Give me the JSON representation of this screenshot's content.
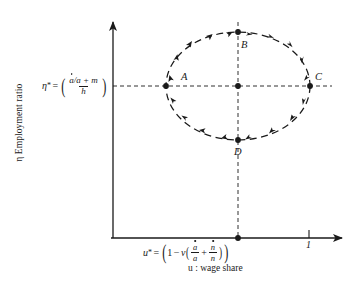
{
  "figure": {
    "type": "phase-portrait",
    "background_color": "#ffffff",
    "line_color": "#1a1a1a"
  },
  "axes": {
    "y": {
      "name": "y-axis",
      "label": "η Employment ratio",
      "symbol": "η",
      "equilibrium": {
        "lhs": "η",
        "superscript": "*",
        "equals": "=",
        "numerator_a_dot": "a",
        "numerator_rest": "/a + m",
        "denominator": "h",
        "plain": "η* = ( (ȧ/a + m) / h )"
      }
    },
    "x": {
      "name": "x-axis",
      "label": "u : wage share",
      "symbol": "u",
      "tick_label": "1",
      "equilibrium": {
        "lhs": "u",
        "superscript": "*",
        "equals": "=",
        "one": "1",
        "minus": "−",
        "v": "v",
        "frac1_num": "a",
        "frac1_den": "a",
        "plus": "+",
        "frac2_num": "n",
        "frac2_den": "n",
        "plain": "u* = ( 1 − v ( ȧ/a + ṅ/n ) )"
      }
    }
  },
  "cycle": {
    "name": "limit-cycle",
    "style": "dashed",
    "direction": "clockwise",
    "center": {
      "x": 238,
      "y": 86
    },
    "radius_x": 72,
    "radius_y": 54,
    "points": [
      {
        "id": "A",
        "label": "A",
        "position": "left",
        "x": 166,
        "y": 86
      },
      {
        "id": "B",
        "label": "B",
        "position": "top",
        "x": 238,
        "y": 32
      },
      {
        "id": "C",
        "label": "C",
        "position": "right",
        "x": 310,
        "y": 86
      },
      {
        "id": "D",
        "label": "D",
        "position": "bottom",
        "x": 238,
        "y": 140
      }
    ],
    "center_point": {
      "id": "E",
      "label": "",
      "x": 238,
      "y": 86
    }
  },
  "guides": {
    "horizontal": {
      "name": "eta-star-guide",
      "y": 86,
      "x_start": 113,
      "x_end": 330,
      "style": "dashed"
    },
    "vertical": {
      "name": "u-star-guide",
      "x": 238,
      "y_start": 22,
      "y_end": 238,
      "style": "dashed"
    }
  }
}
